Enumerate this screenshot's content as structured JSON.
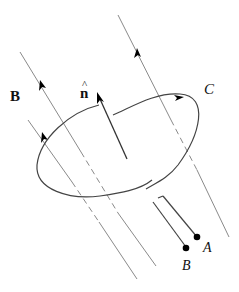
{
  "diagram": {
    "type": "physics-figure",
    "labels": {
      "field": "B",
      "normal": "n",
      "normal_hat": "^",
      "curve": "C",
      "terminal_a": "A",
      "terminal_b": "B"
    },
    "colors": {
      "field_line": "#8a8a8a",
      "loop": "#444444",
      "normal_arrow": "#333333",
      "terminal_dot": "#000000"
    }
  }
}
